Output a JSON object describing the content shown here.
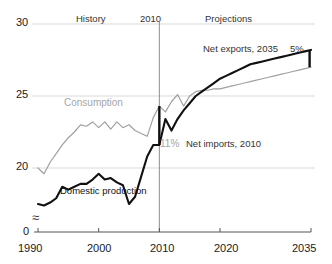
{
  "chart_data": {
    "type": "line",
    "title": "",
    "subtitle": "",
    "xlabel": "",
    "ylabel": "",
    "xlim": [
      1990,
      2035
    ],
    "ylim": [
      0,
      30
    ],
    "y_axis_break": true,
    "y_break_symbol": "≈",
    "grid": true,
    "gridlines": [
      20,
      25,
      30
    ],
    "legend": "inline-labels",
    "x_ticks": [
      "1990",
      "2000",
      "2010",
      "2020",
      "2035"
    ],
    "x_tick_values": [
      1990,
      2000,
      2010,
      2020,
      2035
    ],
    "y_ticks": [
      "0",
      "20",
      "25",
      "30"
    ],
    "y_tick_values": [
      0,
      20,
      25,
      30
    ],
    "divider_year": 2010,
    "region_labels": [
      {
        "name": "history-label",
        "text": "History",
        "x": 1999
      },
      {
        "name": "divider-year-label",
        "text": "2010",
        "x": 2010
      },
      {
        "name": "projections-label",
        "text": "Projections",
        "x": 2022
      }
    ],
    "annotations": [
      {
        "name": "net-exports-annotation",
        "text": "Net exports, 2035",
        "x": 2029,
        "y": 28.9
      },
      {
        "name": "net-exports-value",
        "text": "5%",
        "x": 2034,
        "y": 28.9
      },
      {
        "name": "net-imports-value",
        "text": "11%",
        "x": 2011,
        "y": 21.6
      },
      {
        "name": "net-imports-annotation",
        "text": "Net imports, 2010",
        "x": 2016,
        "y": 21.6
      }
    ],
    "series": [
      {
        "name": "Consumption",
        "label": "Consumption",
        "color": "#a0a0a0",
        "label_x": 1997,
        "label_y": 24.6,
        "x": [
          1990,
          1991,
          1992,
          1993,
          1994,
          1995,
          1996,
          1997,
          1998,
          1999,
          2000,
          2001,
          2002,
          2003,
          2004,
          2005,
          2006,
          2007,
          2008,
          2009,
          2010,
          2011,
          2012,
          2013,
          2014,
          2015,
          2016,
          2017,
          2018,
          2019,
          2020,
          2021,
          2022,
          2023,
          2024,
          2025,
          2026,
          2027,
          2028,
          2029,
          2030,
          2031,
          2032,
          2033,
          2034,
          2035
        ],
        "y": [
          20.0,
          19.6,
          20.4,
          21.0,
          21.6,
          22.1,
          22.5,
          23.0,
          22.9,
          23.2,
          22.8,
          23.2,
          22.7,
          23.2,
          22.8,
          23.0,
          22.6,
          22.4,
          22.2,
          23.5,
          24.3,
          23.9,
          24.6,
          25.1,
          24.3,
          25.0,
          25.3,
          25.4,
          25.4,
          25.5,
          25.5,
          25.6,
          25.7,
          25.8,
          25.9,
          26.0,
          26.1,
          26.2,
          26.3,
          26.4,
          26.5,
          26.6,
          26.7,
          26.8,
          26.9,
          27.0
        ]
      },
      {
        "name": "Domestic production",
        "label": "Domestic production",
        "color": "#111111",
        "label_x": 1998,
        "label_y": 18.3,
        "x": [
          1990,
          1991,
          1992,
          1993,
          1994,
          1995,
          1996,
          1997,
          1998,
          1999,
          2000,
          2001,
          2002,
          2003,
          2004,
          2005,
          2006,
          2007,
          2008,
          2009,
          2010,
          2011,
          2012,
          2013,
          2014,
          2015,
          2016,
          2017,
          2018,
          2019,
          2020,
          2021,
          2022,
          2023,
          2024,
          2025,
          2026,
          2027,
          2028,
          2029,
          2030,
          2031,
          2032,
          2033,
          2034,
          2035
        ],
        "y": [
          17.5,
          17.4,
          17.6,
          17.9,
          18.7,
          18.5,
          18.7,
          18.9,
          18.9,
          19.2,
          19.6,
          19.2,
          19.3,
          19.0,
          18.8,
          17.5,
          18.0,
          19.4,
          20.8,
          21.6,
          21.6,
          23.4,
          22.6,
          23.4,
          24.0,
          24.5,
          25.0,
          25.3,
          25.6,
          25.9,
          26.2,
          26.4,
          26.6,
          26.8,
          27.0,
          27.2,
          27.3,
          27.4,
          27.5,
          27.6,
          27.7,
          27.8,
          27.9,
          28.0,
          28.1,
          28.2
        ]
      }
    ],
    "gap_markers": [
      {
        "name": "net-imports-gap-marker",
        "x": 2010,
        "y_low": 21.6,
        "y_high": 24.3,
        "label": "11%"
      },
      {
        "name": "net-exports-gap-marker",
        "x": 2035,
        "y_low": 27.0,
        "y_high": 28.2,
        "label": "5%"
      }
    ],
    "colors": {
      "consumption": "#a0a0a0",
      "domestic_production": "#111111",
      "grid": "#d9d9d9",
      "axis": "#555555",
      "divider": "#8c8c8c",
      "text": "#1a1a1a"
    }
  }
}
